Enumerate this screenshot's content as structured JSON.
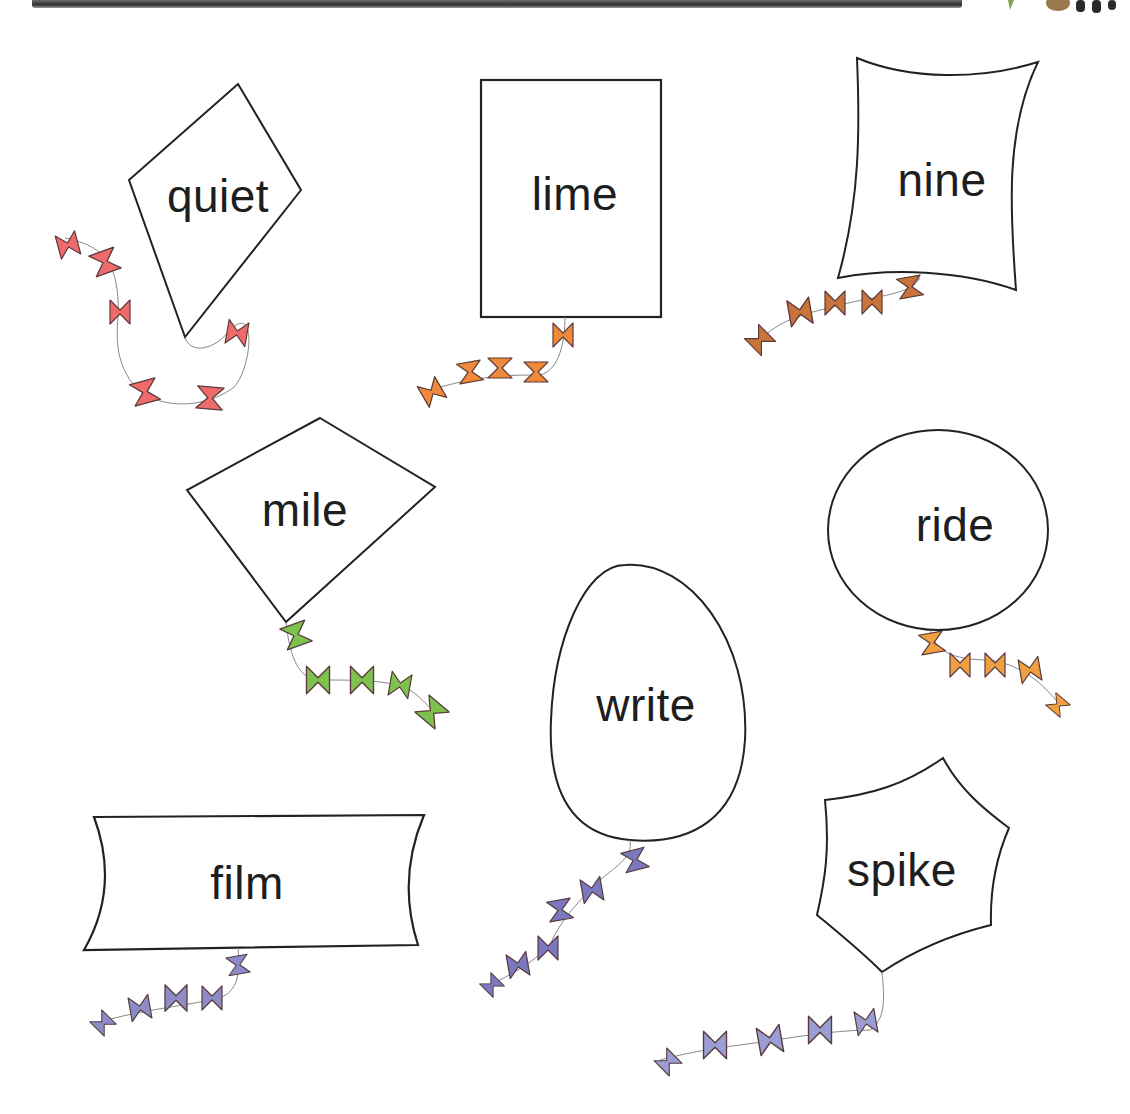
{
  "worksheet": {
    "kites": [
      {
        "word": "quiet",
        "shape": "diamond",
        "tail_color": "#ef6b6b",
        "label_x": 218,
        "label_y": 196
      },
      {
        "word": "lime",
        "shape": "rectangle",
        "tail_color": "#f08a3a",
        "label_x": 575,
        "label_y": 194
      },
      {
        "word": "nine",
        "shape": "curved-square",
        "tail_color": "#c8743a",
        "label_x": 942,
        "label_y": 180
      },
      {
        "word": "mile",
        "shape": "diamond",
        "tail_color": "#7ec24e",
        "label_x": 305,
        "label_y": 510
      },
      {
        "word": "ride",
        "shape": "circle",
        "tail_color": "#f0a040",
        "label_x": 955,
        "label_y": 525
      },
      {
        "word": "write",
        "shape": "oval",
        "tail_color": "#7a78bf",
        "label_x": 646,
        "label_y": 705
      },
      {
        "word": "film",
        "shape": "curved-rectangle",
        "tail_color": "#8c8cc8",
        "label_x": 247,
        "label_y": 883
      },
      {
        "word": "spike",
        "shape": "hexagon",
        "tail_color": "#9a9ed4",
        "label_x": 902,
        "label_y": 870
      }
    ]
  }
}
